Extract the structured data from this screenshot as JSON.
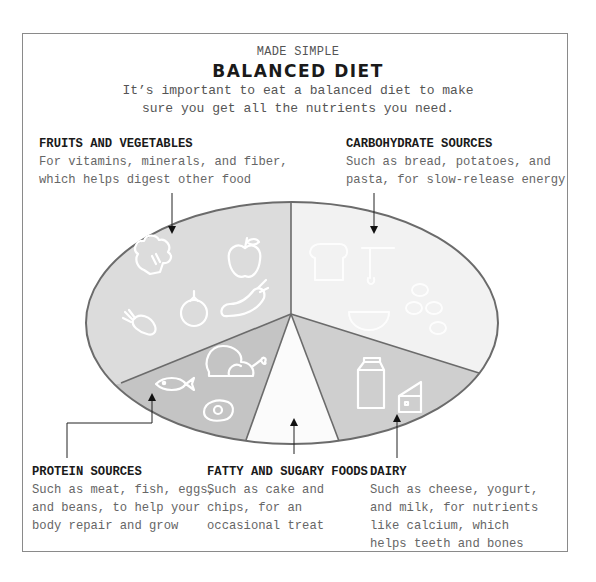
{
  "header": {
    "kicker": "MADE SIMPLE",
    "title": "BALANCED DIET",
    "intro": "It’s important to eat a balanced diet to make sure you get all the nutrients you need."
  },
  "colors": {
    "frame": "#8a8a8a",
    "outline": "#6b6b6b",
    "fruits_vegetables": "#dcdcdc",
    "carbohydrates": "#f2f2f2",
    "dairy": "#cfcfcf",
    "fatty_sugary": "#fbfbfb",
    "protein": "#c4c4c4",
    "icon_stroke": "#ffffff"
  },
  "segments": [
    {
      "id": "fruits-vegetables",
      "heading": "FRUITS AND VEGETABLES",
      "description": "For vitamins, minerals, and fiber,\nwhich helps digest other food",
      "icons": [
        "broccoli-icon",
        "apple-icon",
        "carrot-icon",
        "tomato-icon",
        "eggplant-icon"
      ]
    },
    {
      "id": "carbohydrates",
      "heading": "CARBOHYDRATE SOURCES",
      "description": "Such as bread, potatoes, and\npasta, for slow-release energy",
      "icons": [
        "bread-icon",
        "pasta-icon",
        "bowl-icon",
        "potato-icon"
      ]
    },
    {
      "id": "protein",
      "heading": "PROTEIN SOURCES",
      "description": "Such as meat, fish, eggs,\nand beans, to help your\nbody repair and grow",
      "icons": [
        "fish-icon",
        "chicken-leg-icon",
        "egg-icon"
      ]
    },
    {
      "id": "fatty-sugary",
      "heading": "FATTY AND SUGARY FOODS",
      "description": "Such as cake and\nchips, for an\noccasional treat",
      "icons": []
    },
    {
      "id": "dairy",
      "heading": "DAIRY",
      "description": "Such as cheese, yogurt,\nand milk, for nutrients\nlike calcium, which\nhelps teeth and bones",
      "icons": [
        "milk-carton-icon",
        "cheese-icon"
      ]
    }
  ]
}
